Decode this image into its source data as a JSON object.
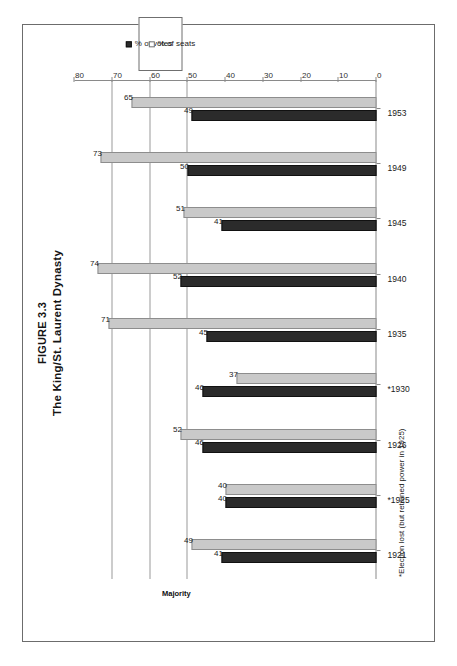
{
  "figure": {
    "number": "FIGURE 3.3",
    "title": "The King/St. Laurent Dynasty",
    "footnote": "*Election lost (but retained power in 1925)",
    "majority_annotation": "Majority"
  },
  "legend": {
    "items": [
      {
        "label": "% of votes",
        "swatch": "filled-dark-square",
        "color": "#2b2b2b"
      },
      {
        "label": "% of seats",
        "swatch": "open-square",
        "color": "#ffffff"
      }
    ]
  },
  "axis": {
    "y_ticks": [
      "0",
      "10",
      "20",
      "30",
      "40",
      "50",
      "60",
      "70",
      "80"
    ],
    "gridline_values": [
      50,
      60,
      70
    ]
  },
  "chart_data": {
    "type": "bar",
    "title": "The King/St. Laurent Dynasty",
    "xlabel": "",
    "ylabel": "",
    "ylim": [
      0,
      80
    ],
    "grid": true,
    "legend_position": "right",
    "orientation": "vertical-bars-rotated-page",
    "categories": [
      "1921",
      "*1925",
      "1926",
      "*1930",
      "1935",
      "1940",
      "1945",
      "1949",
      "1953"
    ],
    "series": [
      {
        "name": "% of votes",
        "values": [
          41,
          40,
          46,
          46,
          45,
          52,
          41,
          50,
          49
        ]
      },
      {
        "name": "% of seats",
        "values": [
          49,
          40,
          52,
          37,
          71,
          74,
          51,
          73,
          65
        ]
      }
    ],
    "annotations": [
      {
        "text": "Majority",
        "y": 50,
        "type": "reference-line-label"
      },
      {
        "text": "*Election lost (but retained power in 1925)",
        "type": "footnote"
      }
    ]
  }
}
